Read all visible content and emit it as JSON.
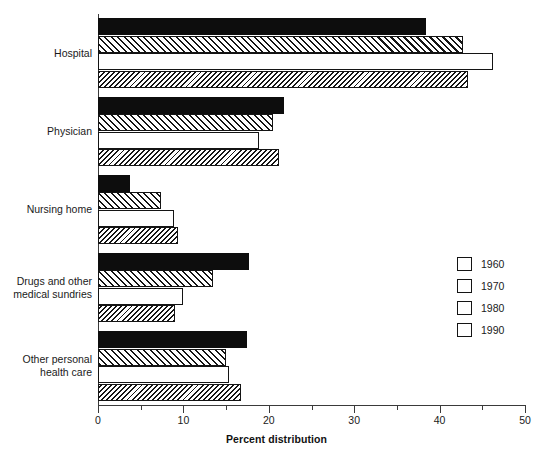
{
  "chart_data": {
    "type": "bar",
    "orientation": "horizontal",
    "title": "",
    "xlabel": "Percent distribution",
    "ylabel": "",
    "xlim": [
      0,
      50
    ],
    "xticks": [
      0,
      10,
      20,
      30,
      40,
      50
    ],
    "xtick_labels": [
      "0",
      "10",
      "20",
      "30",
      "40",
      "50"
    ],
    "minor_ticks": [
      5,
      15,
      25,
      35,
      45
    ],
    "grid": false,
    "legend_position": "right",
    "categories": [
      "Hospital",
      "Physician",
      "Nursing home",
      "Drugs and other medical sundries",
      "Other personal health care"
    ],
    "category_labels": [
      [
        "Hospital"
      ],
      [
        "Physician"
      ],
      [
        "Nursing home"
      ],
      [
        "Drugs and other",
        "medical sundries"
      ],
      [
        "Other personal",
        "health care"
      ]
    ],
    "series": [
      {
        "name": "1960",
        "fill": "solid",
        "values": [
          38.4,
          21.8,
          3.8,
          17.7,
          17.4
        ]
      },
      {
        "name": "1970",
        "fill": "hatch-fwd",
        "values": [
          42.7,
          20.5,
          7.4,
          13.5,
          15.0
        ]
      },
      {
        "name": "1980",
        "fill": "empty",
        "values": [
          46.2,
          18.9,
          8.9,
          9.9,
          15.3
        ]
      },
      {
        "name": "1990",
        "fill": "hatch-back",
        "values": [
          43.3,
          21.2,
          9.4,
          9.0,
          16.7
        ]
      }
    ]
  },
  "legend": {
    "items": [
      {
        "label": "1960",
        "fill": "solid"
      },
      {
        "label": "1970",
        "fill": "hatch-fwd"
      },
      {
        "label": "1980",
        "fill": "empty"
      },
      {
        "label": "1990",
        "fill": "hatch-back"
      }
    ]
  },
  "colors": {
    "bar_solid": "#0d0d0d",
    "bar_outline": "#141414",
    "axis": "#3a3a3a",
    "text": "#1a1a1a",
    "background": "#ffffff"
  }
}
